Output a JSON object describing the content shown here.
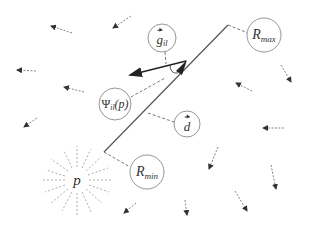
{
  "diagram": {
    "labels": {
      "r_max": {
        "base": "R",
        "sub": "max"
      },
      "r_min": {
        "base": "R",
        "sub": "min"
      },
      "g_il": {
        "base": "g",
        "sub": "il"
      },
      "psi": {
        "base": "Ψ",
        "sub": "il",
        "arg": "(p)"
      },
      "d": {
        "base": "d"
      },
      "p": {
        "base": "p"
      }
    },
    "colors": {
      "line": "#444444",
      "circle": "#8a8a8a",
      "dashed": "#666666",
      "small_arrow": "#555555",
      "radial": "#999999",
      "text": "#333333"
    }
  }
}
